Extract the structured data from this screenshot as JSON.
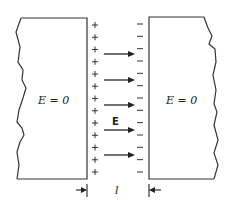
{
  "diagram": {
    "left_region_label": "E = 0",
    "right_region_label": "E = 0",
    "field_label": "E",
    "gap_label": "l",
    "positive_charge_symbol": "+",
    "negative_charge_symbol": "−",
    "positive_charge_count": 13,
    "negative_charge_count": 13,
    "field_arrow_count": 5,
    "colors": {
      "stroke": "#333333",
      "background": "#ffffff"
    }
  }
}
